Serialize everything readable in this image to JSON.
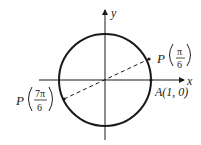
{
  "diagram": {
    "type": "unit-circle",
    "axes": {
      "x_label": "x",
      "y_label": "y"
    },
    "points": [
      {
        "id": "p-pi-6",
        "name": "P",
        "arg_numerator": "π",
        "arg_denominator": "6"
      },
      {
        "id": "p-7pi-6",
        "name": "P",
        "arg_numerator": "7π",
        "arg_denominator": "6"
      },
      {
        "id": "a",
        "label": "A(1, 0)"
      }
    ],
    "segment": {
      "from": "P(7π/6)",
      "to": "P(π/6)",
      "style": "dashed"
    },
    "colors": {
      "stroke": "#1a1a1a",
      "background": "#ffffff"
    }
  }
}
